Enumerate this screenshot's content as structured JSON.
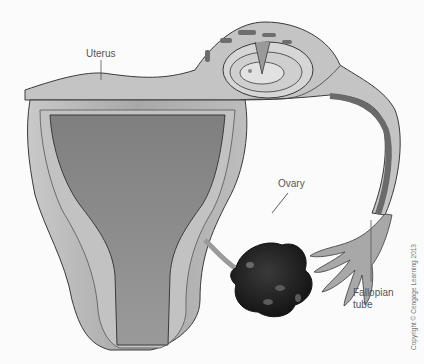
{
  "diagram": {
    "labels": {
      "uterus": "Uterus",
      "ovary": "Ovary",
      "fallopian_line1": "Fallopian",
      "fallopian_line2": "tube"
    },
    "copyright": "Copyright © Cengage Learning 2013",
    "colors": {
      "background": "#fbfbfb",
      "uterus_wall": "#b5b5b5",
      "uterus_cavity": "#8c8c8c",
      "outline": "#3a3a3a",
      "ovary": "#1e1e1e",
      "label_text": "#555555"
    }
  }
}
